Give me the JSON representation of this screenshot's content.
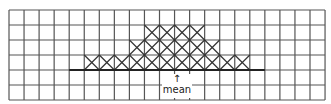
{
  "diagram": {
    "type": "grid-histogram",
    "grid": {
      "columns": 21,
      "rows": 6,
      "left": 9,
      "top": 10,
      "cell_width": 15.05,
      "cell_height": 15,
      "line_color": "#555555"
    },
    "filled_rows": [
      {
        "row": 1,
        "start_col": 9,
        "end_col": 12
      },
      {
        "row": 2,
        "start_col": 8,
        "end_col": 13
      },
      {
        "row": 3,
        "start_col": 5,
        "end_col": 15
      }
    ],
    "baseline": {
      "row_line": 4,
      "start_col": 4,
      "end_col": 17
    },
    "marker": {
      "label": "mean",
      "arrow": "↑",
      "x": 177
    }
  }
}
